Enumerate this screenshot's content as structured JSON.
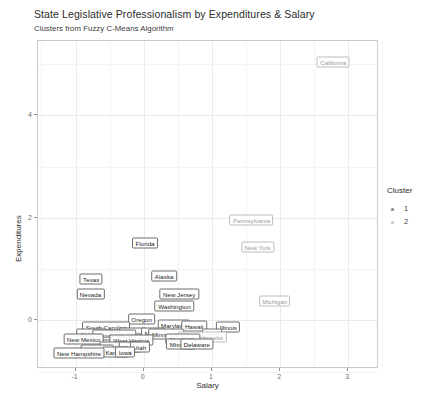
{
  "chart_data": {
    "type": "scatter",
    "title": "State Legislative Professionalism by Expenditures & Salary",
    "subtitle": "Clusters from Fuzzy C-Means Algorithm",
    "xlabel": "Salary",
    "ylabel": "Expenditures",
    "xlim": [
      -1.55,
      3.45
    ],
    "ylim": [
      -0.95,
      5.45
    ],
    "xticks": [
      "-1",
      "0",
      "1",
      "2",
      "3"
    ],
    "xtickvals": [
      -1,
      0,
      1,
      2,
      3
    ],
    "yticks": [
      "0",
      "2",
      "4"
    ],
    "ytickvals": [
      0,
      2,
      4
    ],
    "grid": true,
    "legend": {
      "title": "Cluster",
      "position": "right",
      "entries": [
        {
          "label": "1",
          "glyph": "a",
          "color": "#3a3a3a"
        },
        {
          "label": "2",
          "glyph": "a",
          "color": "#adadad"
        }
      ]
    },
    "points": [
      {
        "label": "California",
        "x": 2.78,
        "y": 5.05,
        "cluster": 2
      },
      {
        "label": "Pennsylvania",
        "x": 1.58,
        "y": 1.96,
        "cluster": 2
      },
      {
        "label": "New York",
        "x": 1.67,
        "y": 1.44,
        "cluster": 2
      },
      {
        "label": "Florida",
        "x": 0.02,
        "y": 1.5,
        "cluster": 1
      },
      {
        "label": "Alaska",
        "x": 0.3,
        "y": 0.86,
        "cluster": 1
      },
      {
        "label": "Texas",
        "x": -0.77,
        "y": 0.8,
        "cluster": 1
      },
      {
        "label": "Nevada",
        "x": -0.78,
        "y": 0.52,
        "cluster": 1
      },
      {
        "label": "New Jersey",
        "x": 0.52,
        "y": 0.52,
        "cluster": 1
      },
      {
        "label": "Washington",
        "x": 0.45,
        "y": 0.28,
        "cluster": 1
      },
      {
        "label": "Michigan",
        "x": 1.92,
        "y": 0.38,
        "cluster": 2
      },
      {
        "label": "Oregon",
        "x": -0.03,
        "y": 0.02,
        "cluster": 1
      },
      {
        "label": "Maryland",
        "x": 0.44,
        "y": -0.1,
        "cluster": 1
      },
      {
        "label": "Hawaii",
        "x": 0.74,
        "y": -0.11,
        "cluster": 1
      },
      {
        "label": "Illinois",
        "x": 1.24,
        "y": -0.13,
        "cluster": 1
      },
      {
        "label": "South Carolina",
        "x": -0.55,
        "y": -0.14,
        "cluster": 1
      },
      {
        "label": "Virginia",
        "x": -0.16,
        "y": -0.24,
        "cluster": 1
      },
      {
        "label": "Maine",
        "x": 0.14,
        "y": -0.24,
        "cluster": 1
      },
      {
        "label": "Minnesota",
        "x": 0.33,
        "y": -0.27,
        "cluster": 1
      },
      {
        "label": "Ohio",
        "x": 1.0,
        "y": -0.26,
        "cluster": 1
      },
      {
        "label": "Massachusetts",
        "x": 0.86,
        "y": -0.33,
        "cluster": 2
      },
      {
        "label": "Alabama",
        "x": -0.76,
        "y": -0.26,
        "cluster": 1
      },
      {
        "label": "Rhode Island",
        "x": -0.43,
        "y": -0.28,
        "cluster": 1
      },
      {
        "label": "New Mexico",
        "x": -0.88,
        "y": -0.36,
        "cluster": 1
      },
      {
        "label": "West Virginia",
        "x": -0.18,
        "y": -0.38,
        "cluster": 1
      },
      {
        "label": "Oklahoma",
        "x": 0.58,
        "y": -0.36,
        "cluster": 1
      },
      {
        "label": "Missouri",
        "x": 0.55,
        "y": -0.46,
        "cluster": 1
      },
      {
        "label": "Delaware",
        "x": 0.78,
        "y": -0.47,
        "cluster": 1
      },
      {
        "label": "Mississippi",
        "x": -0.38,
        "y": -0.52,
        "cluster": 1
      },
      {
        "label": "Idaho",
        "x": -0.2,
        "y": -0.52,
        "cluster": 1
      },
      {
        "label": "Utah",
        "x": -0.06,
        "y": -0.52,
        "cluster": 1
      },
      {
        "label": "Wyoming",
        "x": -0.68,
        "y": -0.58,
        "cluster": 1
      },
      {
        "label": "Kansas",
        "x": -0.41,
        "y": -0.62,
        "cluster": 1
      },
      {
        "label": "Iowa",
        "x": -0.27,
        "y": -0.62,
        "cluster": 1
      },
      {
        "label": "New Hampshire",
        "x": -0.95,
        "y": -0.64,
        "cluster": 1
      }
    ]
  }
}
